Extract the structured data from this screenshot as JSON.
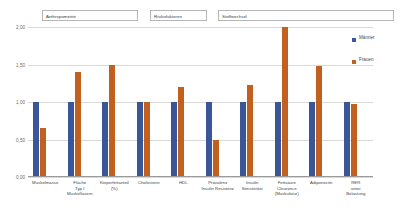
{
  "chart_data": {
    "type": "bar",
    "title": "",
    "xlabel": "",
    "ylabel": "",
    "ylim": [
      0,
      2.0
    ],
    "yticks": [
      "0,00",
      "0,50",
      "1,00",
      "1,50",
      "2,00"
    ],
    "ytick_values": [
      0,
      0.5,
      1.0,
      1.5,
      2.0
    ],
    "grid": true,
    "legend_position": "right",
    "categories": [
      "Muskelmasse",
      "Fläche\nTyp I\nMuskelfasern",
      "Körperfettanteil\n(%)",
      "Cholesterin",
      "HDL",
      "Prävalenz\nInsulin Resistenz",
      "Insulin\nSensitivität",
      "Fettsäure\nClearance\n(Muskulatur)",
      "Adiponectin",
      "RER\nunter\nBelastung"
    ],
    "series": [
      {
        "name": "Männer",
        "color": "#3a5699",
        "values": [
          1.0,
          1.0,
          1.0,
          1.0,
          1.0,
          1.0,
          1.0,
          1.0,
          1.0,
          1.0
        ]
      },
      {
        "name": "Frauen",
        "color": "#c2601f",
        "values": [
          0.65,
          1.4,
          1.5,
          1.0,
          1.2,
          0.5,
          1.23,
          2.0,
          1.48,
          0.97
        ]
      }
    ],
    "groups": [
      {
        "label": "Anthropometrie",
        "span": [
          0,
          2
        ]
      },
      {
        "label": "Risikofaktoren",
        "span": [
          3,
          4
        ]
      },
      {
        "label": "Stoffwechsel",
        "span": [
          5,
          9
        ]
      }
    ]
  }
}
